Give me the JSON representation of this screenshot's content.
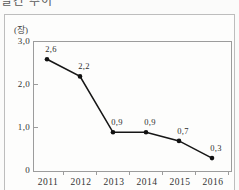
{
  "page": {
    "title": "발간 추이"
  },
  "colors": {
    "line": "#161616",
    "marker": "#111111",
    "axis": "#9c9c9c",
    "box_border": "#bdbdbd",
    "text": "#333333"
  },
  "chart_data": {
    "type": "line",
    "title": "발간 추이",
    "unit_label": "(장)",
    "xlabel": "",
    "ylabel": "(장)",
    "categories": [
      "2011",
      "2012",
      "2013",
      "2014",
      "2015",
      "2016"
    ],
    "values": [
      2.6,
      2.2,
      0.9,
      0.9,
      0.7,
      0.3
    ],
    "point_labels": [
      "2,6",
      "2,2",
      "0,9",
      "0,9",
      "0,7",
      "0,3"
    ],
    "series": [
      {
        "name": "발간 추이",
        "values": [
          2.6,
          2.2,
          0.9,
          0.9,
          0.7,
          0.3
        ]
      }
    ],
    "ylim": [
      0,
      3.0
    ],
    "y_ticks": [
      {
        "value": 3.0,
        "label": "3,0",
        "tick": false
      },
      {
        "value": 2.0,
        "label": "2,0",
        "tick": true
      },
      {
        "value": 1.0,
        "label": "1,0",
        "tick": true
      },
      {
        "value": 0,
        "label": "0",
        "tick": false
      }
    ],
    "grid": false,
    "legend": "none",
    "marker": "circle",
    "line_color": "#161616"
  }
}
